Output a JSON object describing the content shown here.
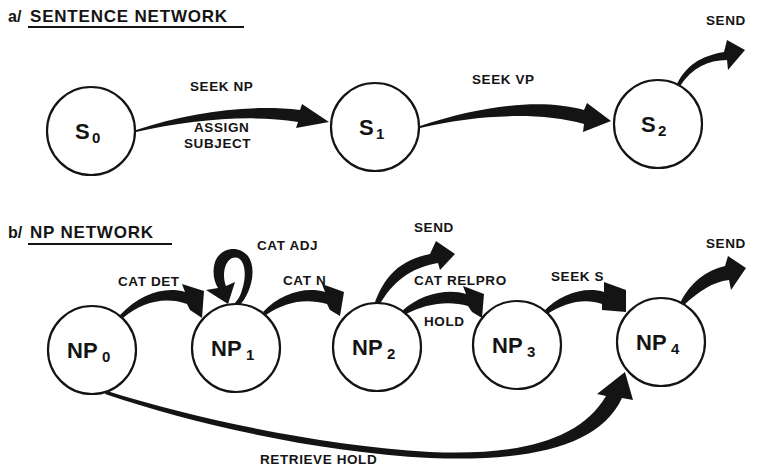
{
  "sections": {
    "a": {
      "prefix": "a/",
      "title": "SENTENCE NETWORK",
      "nodes": [
        {
          "id": "S0",
          "base": "S",
          "sub": "0"
        },
        {
          "id": "S1",
          "base": "S",
          "sub": "1"
        },
        {
          "id": "S2",
          "base": "S",
          "sub": "2"
        }
      ],
      "edges": [
        {
          "from": "S0",
          "to": "S1",
          "label": "SEEK NP",
          "action_line1": "ASSIGN",
          "action_line2": "SUBJECT"
        },
        {
          "from": "S1",
          "to": "S2",
          "label": "SEEK VP"
        },
        {
          "from": "S2",
          "to": "exit",
          "label": "SEND"
        }
      ]
    },
    "b": {
      "prefix": "b/",
      "title": "NP NETWORK",
      "nodes": [
        {
          "id": "NP0",
          "base": "NP",
          "sub": "0"
        },
        {
          "id": "NP1",
          "base": "NP",
          "sub": "1"
        },
        {
          "id": "NP2",
          "base": "NP",
          "sub": "2"
        },
        {
          "id": "NP3",
          "base": "NP",
          "sub": "3"
        },
        {
          "id": "NP4",
          "base": "NP",
          "sub": "4"
        }
      ],
      "edges": [
        {
          "from": "NP0",
          "to": "NP1",
          "label": "CAT DET"
        },
        {
          "from": "NP1",
          "to": "NP1",
          "label": "CAT ADJ"
        },
        {
          "from": "NP1",
          "to": "NP2",
          "label": "CAT N"
        },
        {
          "from": "NP2",
          "to": "exit",
          "label": "SEND"
        },
        {
          "from": "NP2",
          "to": "NP3",
          "label": "CAT RELPRO",
          "action": "HOLD"
        },
        {
          "from": "NP3",
          "to": "NP4",
          "label": "SEEK S"
        },
        {
          "from": "NP4",
          "to": "exit",
          "label": "SEND"
        },
        {
          "from": "NP0",
          "to": "NP4",
          "label": "RETRIEVE HOLD"
        }
      ]
    }
  },
  "colors": {
    "ink": "#141414",
    "paper": "#ffffff"
  }
}
